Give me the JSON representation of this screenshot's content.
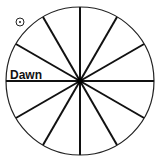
{
  "diagram": {
    "type": "circle divided into 12 equal sectors",
    "center": [
      80,
      81
    ],
    "radius": 74,
    "spokes": 6,
    "stroke_color": "#111111",
    "labels": {
      "dawn": "Dawn"
    },
    "icons": {
      "sun": "sun-symbol-icon"
    }
  }
}
